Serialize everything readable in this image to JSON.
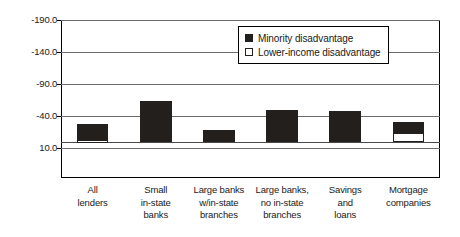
{
  "chart_data": {
    "type": "bar",
    "title": "",
    "subtitle": "",
    "xlabel": "",
    "ylabel": "",
    "categories": [
      "All lenders",
      "Small in-state banks",
      "Large banks w/in-state branches",
      "Large banks, no in-state branches",
      "Savings and loans",
      "Mortgage companies"
    ],
    "category_lines": [
      [
        "All",
        "lenders"
      ],
      [
        "Small",
        "in-state",
        "banks"
      ],
      [
        "Large banks",
        "w/in-state",
        "branches"
      ],
      [
        "Large banks,",
        "no in-state",
        "branches"
      ],
      [
        "Savings",
        "and",
        "loans"
      ],
      [
        "Mortgage",
        "companies"
      ]
    ],
    "series": [
      {
        "name": "Minority disadvantage",
        "color": "#231f1c",
        "style": "filled",
        "values": [
          -28,
          -63,
          -18,
          -50,
          -48,
          -30
        ]
      },
      {
        "name": "Lower-income disadvantage",
        "color": "#ffffff",
        "style": "hollow",
        "values": [
          -3,
          0,
          0,
          0,
          0,
          -13
        ]
      }
    ],
    "yticks": [
      "-190.0",
      "-140.0",
      "-90.0",
      "-40.0",
      "10.0"
    ],
    "ytick_values": [
      -190,
      -140,
      -90,
      -40,
      10
    ],
    "ylim": [
      10,
      -190
    ],
    "y_axis_inverted": true,
    "baseline": 0,
    "grid": true,
    "legend_position": "top-right"
  },
  "legend": {
    "entries": [
      {
        "label": "Minority disadvantage"
      },
      {
        "label": "Lower-income disadvantage"
      }
    ]
  }
}
